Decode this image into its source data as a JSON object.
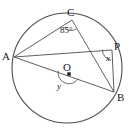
{
  "figure": {
    "type": "circle-geometry-diagram",
    "stroke_color": "#4d4d4d",
    "label_color": "#1a1a1a",
    "background": "#ffffff",
    "width": 133,
    "height": 131
  },
  "circle": {
    "center_label": "O",
    "center_x": 67,
    "center_y": 68,
    "radius": 55
  },
  "points": [
    {
      "name": "A",
      "label": "A",
      "x": 14,
      "y": 57,
      "label_x": 2,
      "label_y": 51
    },
    {
      "name": "C",
      "label": "C",
      "x": 72,
      "y": 20,
      "label_x": 67,
      "label_y": 7
    },
    {
      "name": "P",
      "label": "P",
      "x": 112,
      "y": 50,
      "label_x": 114,
      "label_y": 41
    },
    {
      "name": "B",
      "label": "B",
      "x": 114,
      "y": 92,
      "label_x": 117,
      "label_y": 92
    },
    {
      "name": "O",
      "label": "O",
      "x": 69,
      "y": 74,
      "label_x": 63,
      "label_y": 62
    }
  ],
  "segments": [
    {
      "name": "A-C",
      "from": "A",
      "to": "C"
    },
    {
      "name": "A-P",
      "from": "A",
      "to": "P"
    },
    {
      "name": "A-B",
      "from": "A",
      "to": "B"
    },
    {
      "name": "C-B",
      "from": "C",
      "to": "B"
    },
    {
      "name": "P-B",
      "from": "P",
      "to": "B"
    }
  ],
  "angles": [
    {
      "name": "angle-at-C",
      "label": "85°",
      "vertex": "C",
      "label_x": 60,
      "label_y": 26
    },
    {
      "name": "angle-x-at-P",
      "label": "x",
      "vertex": "P",
      "label_x": 106,
      "label_y": 54
    },
    {
      "name": "angle-y-at-O",
      "label": "y",
      "vertex": "O",
      "label_x": 57,
      "label_y": 82
    }
  ]
}
